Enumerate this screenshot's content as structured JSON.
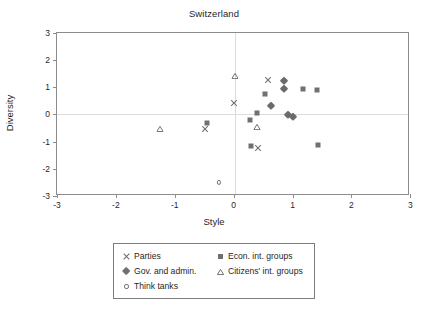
{
  "chart_data": {
    "type": "scatter",
    "title": "Switzerland",
    "xlabel": "Style",
    "ylabel": "Diversity",
    "xlim": [
      -3,
      3
    ],
    "ylim": [
      -3,
      3
    ],
    "xticks": [
      "-3",
      "-2",
      "-1",
      "0",
      "1",
      "2",
      "3"
    ],
    "yticks": [
      "3",
      "2",
      "1",
      "0",
      "-1",
      "-2",
      "-3"
    ],
    "xtick_values": [
      -3,
      -2,
      -1,
      0,
      1,
      2,
      3
    ],
    "ytick_values": [
      3,
      2,
      1,
      0,
      -1,
      -2,
      -3
    ],
    "grid": false,
    "zero_lines": true,
    "legend_position": "below-center",
    "series": [
      {
        "name": "Parties",
        "marker": "cross-icon",
        "color": "#6f7072",
        "points": [
          {
            "x": 0.0,
            "y": 0.4
          },
          {
            "x": 0.58,
            "y": 1.26
          },
          {
            "x": -0.49,
            "y": -0.53
          },
          {
            "x": 0.42,
            "y": -1.25
          }
        ]
      },
      {
        "name": "Econ. int. groups",
        "marker": "square-icon",
        "color": "#6f7072",
        "points": [
          {
            "x": 0.54,
            "y": 0.75
          },
          {
            "x": 1.17,
            "y": 0.92
          },
          {
            "x": 1.41,
            "y": 0.88
          },
          {
            "x": 0.4,
            "y": 0.05
          },
          {
            "x": 0.27,
            "y": -0.2
          },
          {
            "x": -0.45,
            "y": -0.31
          },
          {
            "x": 0.29,
            "y": -1.15
          },
          {
            "x": 1.43,
            "y": -1.12
          }
        ]
      },
      {
        "name": "Gov. and admin.",
        "marker": "diamond-icon",
        "color": "#6a6b6d",
        "points": [
          {
            "x": 0.86,
            "y": 1.24
          },
          {
            "x": 0.86,
            "y": 0.92
          },
          {
            "x": 0.63,
            "y": 0.32
          },
          {
            "x": 0.93,
            "y": -0.04
          },
          {
            "x": 1.01,
            "y": -0.09
          }
        ]
      },
      {
        "name": "Citizens' int. groups",
        "marker": "triangle-icon",
        "color": "#6f7072",
        "points": [
          {
            "x": 0.02,
            "y": 1.42
          },
          {
            "x": 0.4,
            "y": -0.45
          },
          {
            "x": -1.25,
            "y": -0.53
          }
        ]
      },
      {
        "name": "Think tanks",
        "marker": "circle-icon",
        "color": "#6f7072",
        "points": [
          {
            "x": -0.25,
            "y": -2.5
          }
        ]
      }
    ]
  },
  "legend": {
    "left_column": [
      {
        "label": "Parties",
        "marker": "cross-icon"
      },
      {
        "label": "Gov. and admin.",
        "marker": "diamond-icon"
      },
      {
        "label": "Think tanks",
        "marker": "circle-icon"
      }
    ],
    "right_column": [
      {
        "label": "Econ. int. groups",
        "marker": "square-icon"
      },
      {
        "label": "Citizens' int. groups",
        "marker": "triangle-icon"
      }
    ]
  }
}
